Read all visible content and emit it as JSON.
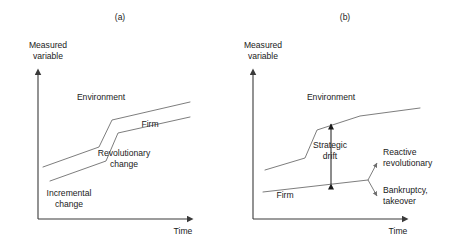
{
  "figure": {
    "type": "diagram",
    "topic": "Strategic drift",
    "background_color": "#ffffff",
    "curve_color": "#6e6e6e",
    "axis_color": "#3a3a3a",
    "text_color": "#1a1a1a"
  },
  "panels": [
    {
      "key": "a",
      "caption": "(a)",
      "caption_x": 120,
      "caption_y": 20,
      "axes": {
        "y_label_line1": "Measured",
        "y_label_line2": "variable",
        "y_label_x": 48,
        "y_label_y1": 48,
        "y_label_y2": 59,
        "x_label": "Time",
        "x_label_x": 183,
        "x_label_y": 234,
        "origin_x": 38,
        "origin_y": 219,
        "y_top": 72,
        "x_right": 190
      },
      "curves": [
        {
          "name": "environment",
          "label": "Environment",
          "label_x": 101,
          "label_y": 100,
          "points": "43,167 99,147 112,120 190,102",
          "stages": [
            "incremental",
            "revolutionary",
            "incremental"
          ]
        },
        {
          "name": "firm",
          "label": "Firm",
          "label_x": 150,
          "label_y": 127,
          "points": "50,181 106,161 118,133 190,117",
          "stages": [
            "incremental",
            "revolutionary",
            "incremental"
          ]
        }
      ],
      "annotations": [
        {
          "name": "revolutionary-change",
          "line1": "Revolutionary",
          "line2": "change",
          "x": 124,
          "y1": 156,
          "y2": 167
        },
        {
          "name": "incremental-change",
          "line1": "Incremental",
          "line2": "change",
          "x": 69,
          "y1": 196,
          "y2": 207
        }
      ]
    },
    {
      "key": "b",
      "caption": "(b)",
      "caption_x": 345,
      "caption_y": 20,
      "axes": {
        "y_label_line1": "Measured",
        "y_label_line2": "variable",
        "y_label_x": 263,
        "y_label_y1": 48,
        "y_label_y2": 59,
        "x_label": "Time",
        "x_label_x": 398,
        "x_label_y": 234,
        "origin_x": 253,
        "origin_y": 219,
        "y_top": 72,
        "x_right": 405
      },
      "curves": [
        {
          "name": "environment",
          "label": "Environment",
          "label_x": 331,
          "label_y": 100,
          "points": "265,170 305,158 317,130 360,116 420,108",
          "stages": [
            "incremental",
            "revolutionary",
            "drift"
          ]
        },
        {
          "name": "firm",
          "label": "Firm",
          "label_x": 285,
          "label_y": 198,
          "points": "263,192 368,180",
          "stages": [
            "flat-drift"
          ]
        }
      ],
      "branch": {
        "name": "outcome-branch",
        "node_x": 368,
        "node_y": 180,
        "arms": [
          {
            "name": "reactive-revolutionary-arm",
            "to_x": 378,
            "to_y": 161
          },
          {
            "name": "bankruptcy-takeover-arm",
            "to_x": 378,
            "to_y": 197
          }
        ]
      },
      "strategic_drift": {
        "name": "strategic-drift-arrow",
        "label_line1": "Strategic",
        "label_line2": "drift",
        "label_x": 330,
        "label_y1": 148,
        "label_y2": 159,
        "arrow_x": 331,
        "arrow_top_y": 122,
        "arrow_bottom_y": 184,
        "double_headed": true
      },
      "annotations": [
        {
          "name": "reactive-revolutionary",
          "line1": "Reactive",
          "line2": "revolutionary",
          "x": 383,
          "y1": 155,
          "y2": 166
        },
        {
          "name": "bankruptcy-takeover",
          "line1": "Bankruptcy,",
          "line2": "takeover",
          "x": 383,
          "y1": 193,
          "y2": 204
        }
      ]
    }
  ]
}
